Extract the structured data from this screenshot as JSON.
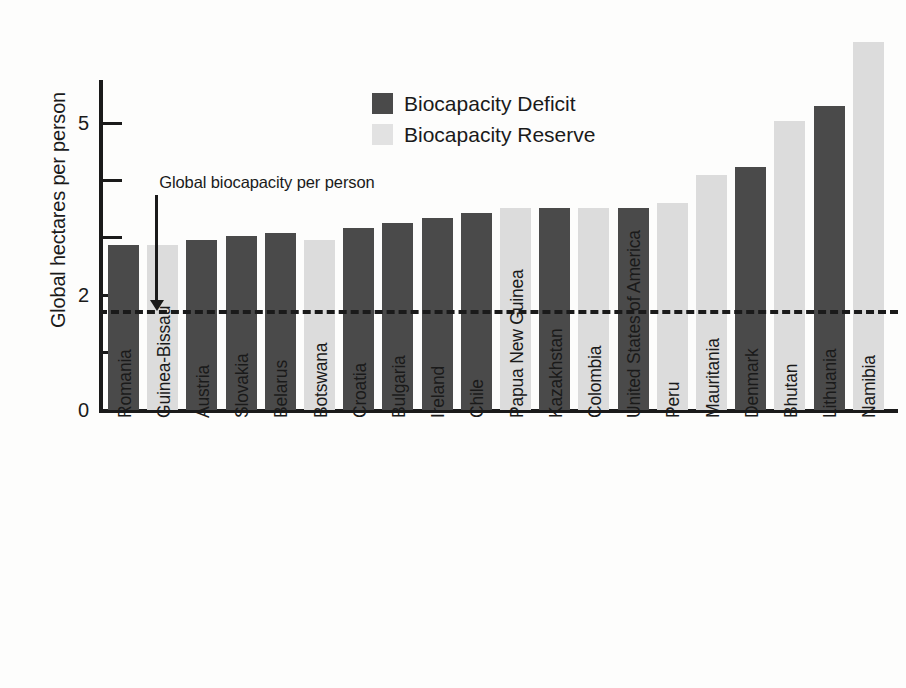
{
  "chart_data": {
    "type": "bar",
    "title": "",
    "xlabel": "",
    "ylabel": "Global hectares per person",
    "ylim": [
      0,
      5.75
    ],
    "grid": false,
    "legend_position": "top-center",
    "y_ticks": [
      {
        "value": 0,
        "label": "0"
      },
      {
        "value": 1,
        "label": ""
      },
      {
        "value": 2,
        "label": "2"
      },
      {
        "value": 3,
        "label": ""
      },
      {
        "value": 4,
        "label": ""
      },
      {
        "value": 5,
        "label": "5"
      }
    ],
    "legend": [
      {
        "name": "Biocapacity Deficit",
        "color": "#4a4a4a"
      },
      {
        "name": "Biocapacity Reserve",
        "color": "#dcdcdc"
      }
    ],
    "reference_line": {
      "label": "Global biocapacity per person",
      "value": 1.67,
      "style": "dashed"
    },
    "categories": [
      "Romania",
      "Guinea-Bissau",
      "Austria",
      "Slovakia",
      "Belarus",
      "Botswana",
      "Croatia",
      "Bulgaria",
      "Ireland",
      "Chile",
      "Papua New Guinea",
      "Kazakhstan",
      "Colombia",
      "United States of America",
      "Peru",
      "Mauritania",
      "Denmark",
      "Bhutan",
      "Lithuania",
      "Namibia"
    ],
    "values": [
      2.87,
      2.87,
      2.97,
      3.03,
      3.08,
      2.97,
      3.18,
      3.25,
      3.34,
      3.43,
      3.52,
      3.52,
      3.52,
      3.52,
      3.6,
      4.09,
      4.23,
      5.03,
      5.3,
      6.42
    ],
    "series_of": [
      "Biocapacity Deficit",
      "Biocapacity Reserve",
      "Biocapacity Deficit",
      "Biocapacity Deficit",
      "Biocapacity Deficit",
      "Biocapacity Reserve",
      "Biocapacity Deficit",
      "Biocapacity Deficit",
      "Biocapacity Deficit",
      "Biocapacity Deficit",
      "Biocapacity Reserve",
      "Biocapacity Deficit",
      "Biocapacity Reserve",
      "Biocapacity Deficit",
      "Biocapacity Reserve",
      "Biocapacity Reserve",
      "Biocapacity Deficit",
      "Biocapacity Reserve",
      "Biocapacity Deficit",
      "Biocapacity Reserve"
    ]
  }
}
